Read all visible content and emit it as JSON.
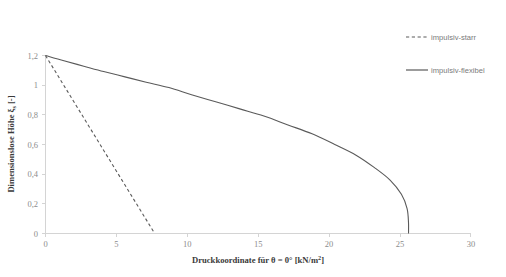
{
  "chart_data": {
    "type": "line",
    "title": "",
    "xlabel": "Druckkoordinate  für θ = 0° [kN/m²]",
    "ylabel": "Dimensionslose  Höhe ξₛ [-]",
    "xlim": [
      0,
      30
    ],
    "ylim": [
      0,
      1.2
    ],
    "xticks": [
      "0",
      "5",
      "10",
      "15",
      "20",
      "25",
      "30"
    ],
    "xtick_values": [
      0,
      5,
      10,
      15,
      20,
      25,
      30
    ],
    "yticks": [
      "0",
      "0,2",
      "0,4",
      "0,6",
      "0,8",
      "1",
      "1,2"
    ],
    "ytick_values": [
      0,
      0.2,
      0.4,
      0.6,
      0.8,
      1.0,
      1.2
    ],
    "grid": false,
    "legend_position": "right",
    "series": [
      {
        "name": "impulsiv-starr",
        "style": "dashed",
        "color": "#5a5a5a",
        "x": [
          0.0,
          0.77,
          1.54,
          2.31,
          3.08,
          3.85,
          4.62,
          5.39,
          6.16,
          6.93,
          7.7
        ],
        "y": [
          1.0,
          0.9,
          0.8,
          0.7,
          0.6,
          0.5,
          0.4,
          0.3,
          0.2,
          0.1,
          0.0
        ]
      },
      {
        "name": "impulsiv-flexibel",
        "style": "solid",
        "color": "#5a5a5a",
        "x": [
          0.0,
          1.3,
          2.7,
          4.1,
          5.6,
          7.1,
          8.7,
          10.3,
          12.0,
          13.7,
          15.4,
          17.1,
          18.8,
          20.4,
          21.9,
          23.2,
          24.3,
          25.1,
          25.5,
          25.6,
          25.6
        ],
        "y": [
          1.0,
          0.97,
          0.94,
          0.91,
          0.88,
          0.85,
          0.82,
          0.78,
          0.74,
          0.7,
          0.66,
          0.61,
          0.56,
          0.5,
          0.44,
          0.37,
          0.3,
          0.22,
          0.14,
          0.06,
          0.0
        ]
      }
    ]
  },
  "legend": {
    "entries": [
      {
        "label": "impulsiv-starr",
        "style": "dashed"
      },
      {
        "label": "impulsiv-flexibel",
        "style": "solid"
      }
    ]
  }
}
